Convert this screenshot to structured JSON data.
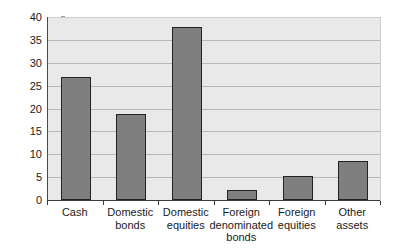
{
  "chart_data": {
    "type": "bar",
    "title": "",
    "subtitle": "",
    "xlabel": "",
    "ylabel": "Percent",
    "categories": [
      "Cash",
      "Domestic bonds",
      "Domestic equities",
      "Foreign denominated bonds",
      "Foreign equities",
      "Other assets"
    ],
    "category_lines": [
      [
        "Cash"
      ],
      [
        "Domestic",
        "bonds"
      ],
      [
        "Domestic",
        "equities"
      ],
      [
        "Foreign",
        "denominated",
        "bonds"
      ],
      [
        "Foreign",
        "equities"
      ],
      [
        "Other",
        "assets"
      ]
    ],
    "values": [
      26.8,
      18.9,
      37.9,
      2.1,
      5.3,
      8.5
    ],
    "ylim": [
      0,
      40
    ],
    "ytick_labels": [
      "40",
      "35",
      "30",
      "25",
      "20",
      "15",
      "10",
      "5",
      "0"
    ],
    "ytick_values": [
      40,
      35,
      30,
      25,
      20,
      15,
      10,
      5,
      0
    ],
    "grid": true,
    "legend": "none",
    "colors": {
      "bar_fill": "#7f7f7f",
      "bar_edge": "#232323",
      "plot_background": "#e9e9e9",
      "gridline": "#b9b9b9",
      "axis": "#3a3a3a",
      "text": "#1a1a1a",
      "figure_background": "#ffffff"
    }
  }
}
